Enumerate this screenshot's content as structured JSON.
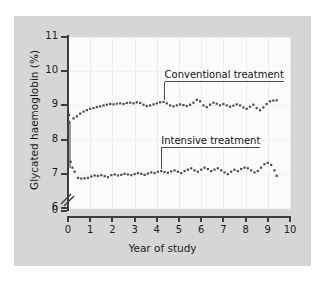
{
  "figure": {
    "background_color": "#d6d6d6",
    "plot_background_color": "#fbfbfb",
    "axis_color": "#3d3d3d",
    "marker_color": "#4b4b4b"
  },
  "annotations": [
    {
      "name": "conventional",
      "label": "Conventional treatment"
    },
    {
      "name": "intensive",
      "label": "Intensive treatment"
    }
  ],
  "chart_data": {
    "type": "line",
    "title": "",
    "subtitle": "",
    "xlabel": "Year of study",
    "ylabel": "Glycated haemoglobin (%)",
    "xlim": [
      0,
      10
    ],
    "ylim": [
      6,
      11
    ],
    "y_axis_break": true,
    "y_break_between": [
      0,
      6
    ],
    "xticks": [
      0,
      1,
      2,
      3,
      4,
      5,
      6,
      7,
      8,
      9,
      10
    ],
    "xticklabels": [
      "0",
      "1",
      "2",
      "3",
      "4",
      "5",
      "6",
      "7",
      "8",
      "9",
      "10"
    ],
    "yticks": [
      0,
      6,
      7,
      8,
      9,
      10,
      11
    ],
    "yticklabels": [
      "0",
      "6",
      "7",
      "8",
      "9",
      "10",
      "11"
    ],
    "grid": true,
    "legend_position": "inline-annotation",
    "marker": "square-dot",
    "line_style": "none",
    "series": [
      {
        "name": "Conventional treatment",
        "annotation": "Conventional treatment",
        "x": [
          0.05,
          0.25,
          0.4,
          0.55,
          0.7,
          0.85,
          1.0,
          1.15,
          1.3,
          1.45,
          1.6,
          1.75,
          1.9,
          2.05,
          2.2,
          2.35,
          2.5,
          2.65,
          2.8,
          2.95,
          3.1,
          3.25,
          3.4,
          3.55,
          3.7,
          3.85,
          4.0,
          4.15,
          4.3,
          4.45,
          4.6,
          4.75,
          4.9,
          5.05,
          5.2,
          5.35,
          5.5,
          5.65,
          5.8,
          5.95,
          6.1,
          6.25,
          6.4,
          6.55,
          6.7,
          6.85,
          7.0,
          7.15,
          7.3,
          7.45,
          7.6,
          7.75,
          7.9,
          8.05,
          8.2,
          8.35,
          8.5,
          8.65,
          8.8,
          8.95,
          9.1,
          9.25,
          9.4
        ],
        "y": [
          8.72,
          8.62,
          8.68,
          8.76,
          8.82,
          8.86,
          8.9,
          8.92,
          8.95,
          8.97,
          9.0,
          9.02,
          9.04,
          9.03,
          9.05,
          9.06,
          9.04,
          9.07,
          9.08,
          9.06,
          9.09,
          9.07,
          9.02,
          8.98,
          9.0,
          9.03,
          9.06,
          9.09,
          9.1,
          9.06,
          9.0,
          8.97,
          9.0,
          9.03,
          9.01,
          8.98,
          9.02,
          9.08,
          9.16,
          9.12,
          9.0,
          8.95,
          9.02,
          9.08,
          9.05,
          9.0,
          9.04,
          9.0,
          8.96,
          8.99,
          9.03,
          9.0,
          8.94,
          8.9,
          8.96,
          9.02,
          8.92,
          8.86,
          8.94,
          9.04,
          9.12,
          9.14,
          9.15
        ],
        "color": "#4b4b4b"
      },
      {
        "name": "Intensive treatment",
        "annotation": "Intensive treatment",
        "x": [
          0.05,
          0.12,
          0.2,
          0.3,
          0.45,
          0.6,
          0.75,
          0.9,
          1.05,
          1.2,
          1.35,
          1.5,
          1.65,
          1.8,
          1.95,
          2.1,
          2.25,
          2.4,
          2.55,
          2.7,
          2.85,
          3.0,
          3.15,
          3.3,
          3.45,
          3.6,
          3.75,
          3.9,
          4.05,
          4.2,
          4.35,
          4.5,
          4.65,
          4.8,
          4.95,
          5.1,
          5.25,
          5.4,
          5.55,
          5.7,
          5.85,
          6.0,
          6.15,
          6.3,
          6.45,
          6.6,
          6.75,
          6.9,
          7.05,
          7.2,
          7.35,
          7.5,
          7.65,
          7.8,
          7.95,
          8.1,
          8.25,
          8.4,
          8.55,
          8.7,
          8.85,
          9.0,
          9.15,
          9.3,
          9.4
        ],
        "y": [
          8.52,
          7.35,
          7.18,
          7.06,
          6.88,
          6.86,
          6.87,
          6.88,
          6.92,
          6.95,
          6.94,
          6.96,
          6.93,
          6.9,
          6.96,
          6.98,
          6.95,
          6.97,
          7.0,
          6.98,
          6.96,
          6.99,
          7.02,
          7.0,
          6.97,
          7.01,
          7.04,
          7.02,
          7.06,
          7.08,
          7.05,
          7.03,
          7.07,
          7.1,
          7.06,
          7.02,
          7.08,
          7.12,
          7.16,
          7.1,
          7.06,
          7.12,
          7.18,
          7.14,
          7.08,
          7.12,
          7.16,
          7.1,
          7.04,
          6.99,
          7.06,
          7.12,
          7.08,
          7.14,
          7.18,
          7.16,
          7.1,
          7.04,
          7.08,
          7.18,
          7.28,
          7.32,
          7.26,
          7.1,
          6.94
        ],
        "color": "#4b4b4b"
      }
    ],
    "initial_drop_marker": {
      "description": "vertical drop line at baseline from 8.52 to 7.18",
      "x": 0.08,
      "y_top": 8.52,
      "y_bottom": 7.18
    }
  }
}
